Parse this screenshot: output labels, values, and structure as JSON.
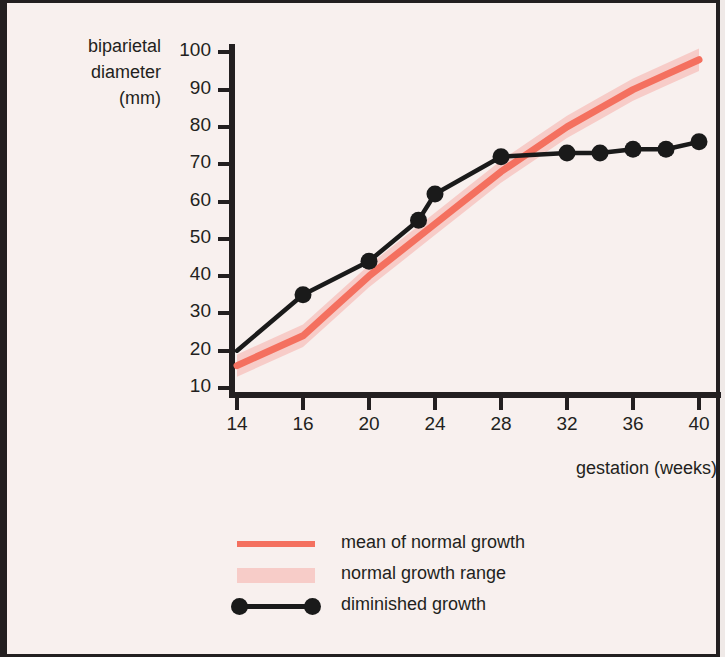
{
  "figure": {
    "background_color": "#f8f0ee",
    "border_color": "#231f20"
  },
  "axes": {
    "ylabel_line1": "biparietal",
    "ylabel_line2": "diameter",
    "ylabel_line3": "(mm)",
    "xlabel": "gestation (weeks)"
  },
  "legend": {
    "items": [
      {
        "label": "mean of normal growth",
        "key": "line",
        "color": "#f4705f"
      },
      {
        "label": "normal growth range",
        "key": "band",
        "color": "#f7ccc8"
      },
      {
        "label": "diminished growth",
        "key": "dotline",
        "color": "#1a1a1a"
      }
    ]
  },
  "chart_data": {
    "type": "line",
    "title": "",
    "xlabel": "gestation (weeks)",
    "ylabel": "biparietal diameter (mm)",
    "xtick_labels": [
      "14",
      "16",
      "20",
      "24",
      "28",
      "32",
      "36",
      "40"
    ],
    "xtick_values": [
      14,
      16,
      20,
      24,
      28,
      32,
      36,
      40
    ],
    "ytick_labels": [
      "10",
      "20",
      "30",
      "40",
      "50",
      "60",
      "70",
      "80",
      "90",
      "100"
    ],
    "ytick_values": [
      10,
      20,
      30,
      40,
      50,
      60,
      70,
      80,
      90,
      100
    ],
    "ylim": [
      10,
      100
    ],
    "grid": false,
    "legend_position": "below-plot-center",
    "series": [
      {
        "name": "mean of normal growth",
        "type": "line",
        "color": "#f4705f",
        "x": [
          14,
          16,
          18,
          20,
          22,
          24,
          26,
          28,
          30,
          32,
          34,
          36,
          38,
          40
        ],
        "values": [
          16,
          24,
          32,
          40,
          47,
          54,
          61,
          68,
          74,
          80,
          85,
          90,
          94,
          98
        ]
      },
      {
        "name": "normal growth range",
        "type": "band",
        "color": "#f7ccc8",
        "x": [
          14,
          16,
          18,
          20,
          22,
          24,
          26,
          28,
          30,
          32,
          34,
          36,
          38,
          40
        ],
        "upper": [
          19,
          27,
          35,
          43,
          50,
          57,
          64,
          71,
          77,
          83,
          88,
          93,
          97,
          101
        ],
        "lower": [
          13,
          21,
          29,
          37,
          44,
          51,
          58,
          65,
          71,
          77,
          82,
          87,
          91,
          95
        ]
      },
      {
        "name": "diminished growth",
        "type": "line-markers",
        "color": "#1a1a1a",
        "x": [
          14,
          16,
          20,
          23,
          24,
          28,
          32,
          34,
          36,
          38,
          40
        ],
        "values": [
          20,
          35,
          44,
          55,
          62,
          72,
          73,
          73,
          74,
          74,
          76
        ]
      }
    ]
  }
}
